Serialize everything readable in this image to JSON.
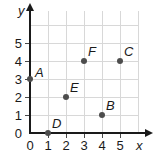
{
  "chart_data": {
    "type": "scatter",
    "title": "",
    "xlabel": "x",
    "ylabel": "y",
    "xlim": [
      0,
      6
    ],
    "ylim": [
      0,
      6
    ],
    "grid": true,
    "legend": "none",
    "x_ticks": [
      "0",
      "1",
      "2",
      "3",
      "4",
      "5"
    ],
    "y_ticks": [
      "0",
      "1",
      "2",
      "3",
      "4",
      "5"
    ],
    "points": [
      {
        "label": "A",
        "x": 0,
        "y": 3,
        "label_pos": "right"
      },
      {
        "label": "B",
        "x": 4,
        "y": 1,
        "label_pos": "above-right"
      },
      {
        "label": "C",
        "x": 5,
        "y": 4,
        "label_pos": "above-right"
      },
      {
        "label": "D",
        "x": 1,
        "y": 0,
        "label_pos": "above-right"
      },
      {
        "label": "E",
        "x": 2,
        "y": 2,
        "label_pos": "above-right"
      },
      {
        "label": "F",
        "x": 3,
        "y": 4,
        "label_pos": "above-right"
      }
    ]
  },
  "colors": {
    "background": "#ffffff",
    "axis": "#1a1a1a",
    "gridline": "#d8d8d8",
    "point": "#4d4d4d",
    "text": "#1a1a1a"
  }
}
